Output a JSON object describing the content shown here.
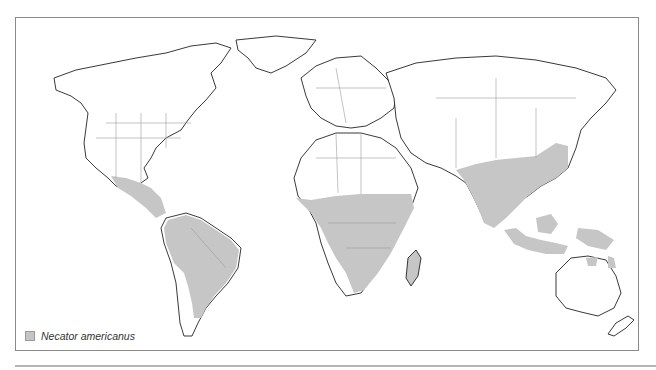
{
  "map": {
    "type": "world-distribution-map",
    "projection": "robinson-like",
    "legend": {
      "items": [
        {
          "label": "Necator americanus",
          "color": "#c6c6c6"
        }
      ]
    },
    "shaded_regions": [
      "Mexico (south) and Central America",
      "Northern and central South America (Brazil, Amazon basin, Paraguay, northern Argentina)",
      "Sub-Saharan Africa (West Africa, Central Africa, East Africa, southeastern Africa)",
      "Madagascar",
      "India",
      "Southern China",
      "Southeast Asia and Indonesia",
      "New Guinea",
      "Northern Australia (Arnhem Land, Cape York)"
    ],
    "colors": {
      "land": "#ffffff",
      "coastline": "#222222",
      "borders": "#9a9a9a",
      "shaded": "#c6c6c6",
      "frame": "#8a8a8a"
    }
  }
}
